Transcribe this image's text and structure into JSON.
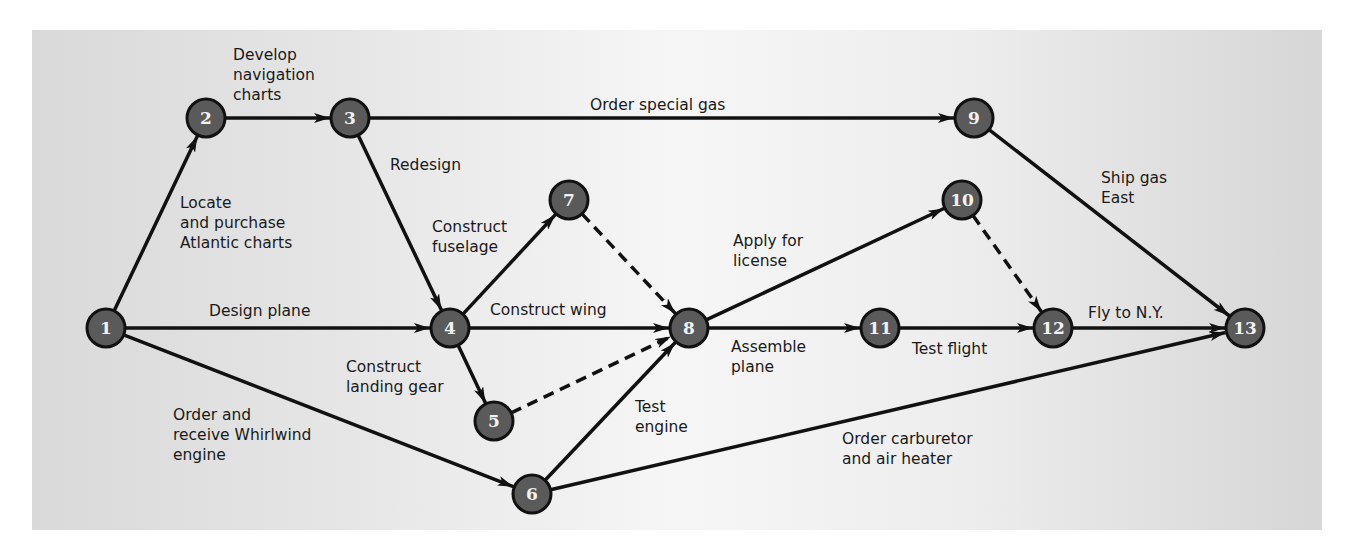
{
  "diagram": {
    "type": "activity-on-arrow network (PERT)",
    "colors": {
      "node_fill": "#5a5a5a",
      "node_stroke": "#111111",
      "edge": "#111111",
      "text": "#1a1a1a",
      "node_text": "#f2f2f2"
    },
    "nodes": [
      {
        "id": "1",
        "x": 106,
        "y": 328
      },
      {
        "id": "2",
        "x": 206,
        "y": 118
      },
      {
        "id": "3",
        "x": 350,
        "y": 118
      },
      {
        "id": "4",
        "x": 450,
        "y": 328
      },
      {
        "id": "5",
        "x": 494,
        "y": 421
      },
      {
        "id": "6",
        "x": 532,
        "y": 494
      },
      {
        "id": "7",
        "x": 569,
        "y": 200
      },
      {
        "id": "8",
        "x": 689,
        "y": 328
      },
      {
        "id": "9",
        "x": 974,
        "y": 118
      },
      {
        "id": "10",
        "x": 962,
        "y": 200
      },
      {
        "id": "11",
        "x": 880,
        "y": 328
      },
      {
        "id": "12",
        "x": 1053,
        "y": 328
      },
      {
        "id": "13",
        "x": 1245,
        "y": 328
      }
    ],
    "edges": [
      {
        "from": "1",
        "to": "2",
        "label": [
          "Locate",
          "and purchase",
          "Atlantic charts"
        ],
        "dashed": false,
        "lx": 180,
        "ly": 208
      },
      {
        "from": "2",
        "to": "3",
        "label": [
          "Develop",
          "navigation",
          "charts"
        ],
        "dashed": false,
        "lx": 233,
        "ly": 60
      },
      {
        "from": "3",
        "to": "9",
        "label": [
          "Order special gas"
        ],
        "dashed": false,
        "lx": 590,
        "ly": 110
      },
      {
        "from": "3",
        "to": "4",
        "label": [
          "Redesign"
        ],
        "dashed": false,
        "lx": 390,
        "ly": 170
      },
      {
        "from": "1",
        "to": "4",
        "label": [
          "Design plane"
        ],
        "dashed": false,
        "lx": 209,
        "ly": 316
      },
      {
        "from": "1",
        "to": "6",
        "label": [
          "Order and",
          "receive Whirlwind",
          "engine"
        ],
        "dashed": false,
        "lx": 173,
        "ly": 420
      },
      {
        "from": "4",
        "to": "7",
        "label": [
          "Construct",
          "fuselage"
        ],
        "dashed": false,
        "lx": 432,
        "ly": 232
      },
      {
        "from": "4",
        "to": "8",
        "label": [
          "Construct wing"
        ],
        "dashed": false,
        "lx": 490,
        "ly": 315
      },
      {
        "from": "4",
        "to": "5",
        "label": [
          "Construct",
          "landing gear"
        ],
        "dashed": false,
        "lx": 346,
        "ly": 372
      },
      {
        "from": "7",
        "to": "8",
        "label": [],
        "dashed": true
      },
      {
        "from": "5",
        "to": "8",
        "label": [],
        "dashed": true
      },
      {
        "from": "6",
        "to": "8",
        "label": [
          "Test",
          "engine"
        ],
        "dashed": false,
        "lx": 635,
        "ly": 412
      },
      {
        "from": "8",
        "to": "10",
        "label": [
          "Apply for",
          "license"
        ],
        "dashed": false,
        "lx": 733,
        "ly": 246
      },
      {
        "from": "8",
        "to": "11",
        "label": [
          "Assemble",
          "plane"
        ],
        "dashed": false,
        "lx": 731,
        "ly": 352
      },
      {
        "from": "11",
        "to": "12",
        "label": [
          "Test flight"
        ],
        "dashed": false,
        "lx": 912,
        "ly": 354
      },
      {
        "from": "10",
        "to": "12",
        "label": [],
        "dashed": true
      },
      {
        "from": "12",
        "to": "13",
        "label": [
          "Fly to N.Y."
        ],
        "dashed": false,
        "lx": 1088,
        "ly": 318
      },
      {
        "from": "9",
        "to": "13",
        "label": [
          "Ship gas",
          "East"
        ],
        "dashed": false,
        "lx": 1101,
        "ly": 183
      },
      {
        "from": "6",
        "to": "13",
        "label": [
          "Order carburetor",
          "and air heater"
        ],
        "dashed": false,
        "lx": 842,
        "ly": 444
      }
    ]
  }
}
